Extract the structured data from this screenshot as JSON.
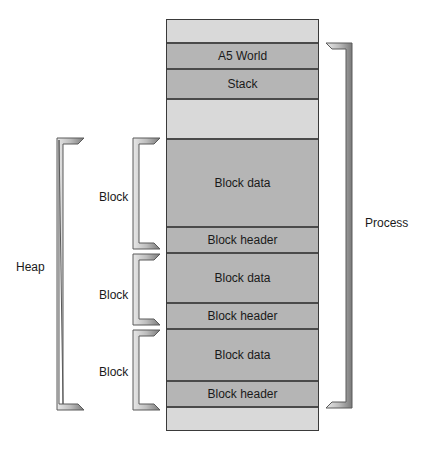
{
  "diagram": {
    "title": "",
    "memory_segments": [
      {
        "id": "top-unused",
        "label": "",
        "shade": "light",
        "top": 0,
        "height": 24
      },
      {
        "id": "a5-world",
        "label": "A5 World",
        "shade": "dark",
        "top": 24,
        "height": 26
      },
      {
        "id": "stack",
        "label": "Stack",
        "shade": "dark",
        "top": 50,
        "height": 30
      },
      {
        "id": "free-space",
        "label": "",
        "shade": "light",
        "top": 80,
        "height": 40
      },
      {
        "id": "block-1-data",
        "label": "Block data",
        "shade": "dark",
        "top": 120,
        "height": 88
      },
      {
        "id": "block-1-header",
        "label": "Block header",
        "shade": "dark",
        "top": 208,
        "height": 26
      },
      {
        "id": "block-2-data",
        "label": "Block data",
        "shade": "dark",
        "top": 234,
        "height": 50
      },
      {
        "id": "block-2-header",
        "label": "Block header",
        "shade": "dark",
        "top": 284,
        "height": 26
      },
      {
        "id": "block-3-data",
        "label": "Block data",
        "shade": "dark",
        "top": 310,
        "height": 52
      },
      {
        "id": "block-3-header",
        "label": "Block header",
        "shade": "dark",
        "top": 362,
        "height": 26
      },
      {
        "id": "bottom-unused",
        "label": "",
        "shade": "light",
        "top": 388,
        "height": 22
      }
    ],
    "left_labels": {
      "heap": "Heap",
      "block_1": "Block",
      "block_2": "Block",
      "block_3": "Block"
    },
    "right_labels": {
      "process": "Process"
    },
    "colors": {
      "light_segment": "#d9d9d9",
      "dark_segment": "#b5b5b5",
      "border": "#3a3a3a",
      "bracket_fill": "#c8c8c8",
      "bracket_shadow": "#6a6a6a"
    }
  }
}
